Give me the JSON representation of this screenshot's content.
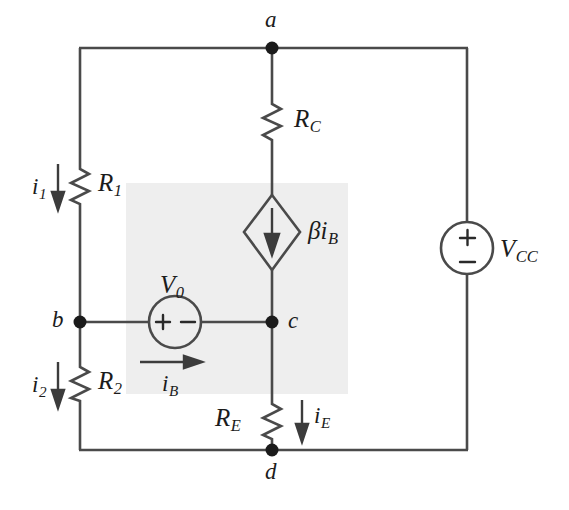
{
  "figure": {
    "kind": "circuit-schematic",
    "title": "",
    "background_color": "#ffffff",
    "wire_color": "#4a4a4a",
    "ink_color": "#1b1b1b",
    "highlight_color": "#eeeeee"
  },
  "nodes": {
    "a": "a",
    "b": "b",
    "c": "c",
    "d": "d"
  },
  "resistors": {
    "rc": "R",
    "rc_sub": "C",
    "r1": "R",
    "r1_sub": "1",
    "r2": "R",
    "r2_sub": "2",
    "re": "R",
    "re_sub": "E"
  },
  "sources": {
    "v0": "V",
    "v0_sub": "0",
    "vcc": "V",
    "vcc_sub": "CC",
    "dependent": "βi",
    "dependent_sub": "B",
    "v0_plus": "+",
    "v0_minus": "−",
    "vcc_plus": "+",
    "vcc_minus": "−"
  },
  "currents": {
    "i1": "i",
    "i1_sub": "1",
    "i2": "i",
    "i2_sub": "2",
    "ib": "i",
    "ib_sub": "B",
    "ie": "i",
    "ie_sub": "E"
  }
}
